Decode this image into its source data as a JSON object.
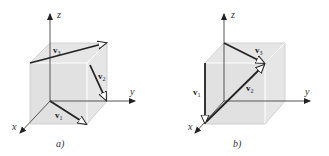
{
  "figure": {
    "panels": [
      {
        "id": "a",
        "caption": "a)",
        "axes": {
          "x": "x",
          "y": "y",
          "z": "z"
        },
        "vectors": [
          {
            "name": "v",
            "sub": "1"
          },
          {
            "name": "v",
            "sub": "2"
          },
          {
            "name": "v",
            "sub": "3"
          }
        ]
      },
      {
        "id": "b",
        "caption": "b)",
        "axes": {
          "x": "x",
          "y": "y",
          "z": "z"
        },
        "vectors": [
          {
            "name": "v",
            "sub": "1"
          },
          {
            "name": "v",
            "sub": "2"
          },
          {
            "name": "v",
            "sub": "3"
          }
        ]
      }
    ],
    "colors": {
      "cube_fill": "#e6e6e6",
      "vector": "#222222",
      "axis": "#555555"
    }
  }
}
